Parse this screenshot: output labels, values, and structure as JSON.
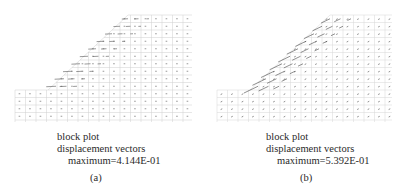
{
  "figure": {
    "panels": [
      {
        "id": "a",
        "label": "(a)",
        "title": "block plot",
        "subtitle": "displacement vectors",
        "maximum": "maximum=4.144E-01",
        "mesh_color": "#c8c8c8",
        "vector_color": "#555555"
      },
      {
        "id": "b",
        "label": "(b)",
        "title": "block plot",
        "subtitle": "displacement vectors",
        "maximum": "maximum=5.392E-01",
        "mesh_color": "#d0d0d0",
        "vector_color": "#444444"
      }
    ]
  }
}
